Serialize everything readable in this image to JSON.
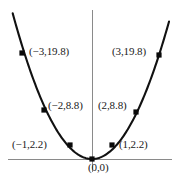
{
  "figure": {
    "name": "parabola-plot",
    "background_color": "#ffffff",
    "axis_color": "#8a8a8a",
    "curve_color": "#111111",
    "marker_color": "#0a0a0a",
    "label_color": "#1a1a1a"
  },
  "chart_data": {
    "type": "scatter",
    "title": "",
    "subtitle": "",
    "xlabel": "",
    "ylabel": "",
    "grid": false,
    "legend": null,
    "xlim": [
      -3.8,
      3.7
    ],
    "ylim": [
      -1.5,
      24
    ],
    "axes": {
      "x_axis_visible": true,
      "y_axis_visible": true,
      "x_tick_labels": [],
      "y_tick_labels": []
    },
    "relationship": "y = 2.2 x^2",
    "x": [
      -3,
      -2,
      -1,
      0,
      1,
      2,
      3
    ],
    "values": [
      19.8,
      8.8,
      2.2,
      0,
      2.2,
      8.8,
      19.8
    ],
    "series": [
      {
        "name": "parabola",
        "x": [
          -3,
          -2,
          -1,
          0,
          1,
          2,
          3
        ],
        "values": [
          19.8,
          8.8,
          2.2,
          0,
          2.2,
          8.8,
          19.8
        ]
      }
    ],
    "points": [
      {
        "label": "(−3,19.8)",
        "x": -3,
        "y": 19.8,
        "px": 22,
        "py": 53,
        "label_x": 29,
        "label_y": 46,
        "anchor": "left"
      },
      {
        "label": "(−2,8.8)",
        "x": -2,
        "y": 8.8,
        "px": 44,
        "py": 110,
        "label_x": 48,
        "label_y": 100,
        "anchor": "left"
      },
      {
        "label": "(−1,2.2)",
        "x": -1,
        "y": 2.2,
        "px": 70,
        "py": 145,
        "label_x": 12,
        "label_y": 139,
        "anchor": "left"
      },
      {
        "label": "(0,0)",
        "x": 0,
        "y": 0,
        "px": 92,
        "py": 159,
        "label_x": 88,
        "label_y": 162,
        "anchor": "left"
      },
      {
        "label": "(1,2.2)",
        "x": 1,
        "y": 2.2,
        "px": 112,
        "py": 145,
        "label_x": 119,
        "label_y": 139,
        "anchor": "left"
      },
      {
        "label": "(2,8.8)",
        "x": 2,
        "y": 8.8,
        "px": 136,
        "py": 112,
        "label_x": 98,
        "label_y": 100,
        "anchor": "left"
      },
      {
        "label": "(3,19.8)",
        "x": 3,
        "y": 19.8,
        "px": 159,
        "py": 55,
        "label_x": 112,
        "label_y": 46,
        "anchor": "left"
      }
    ]
  }
}
